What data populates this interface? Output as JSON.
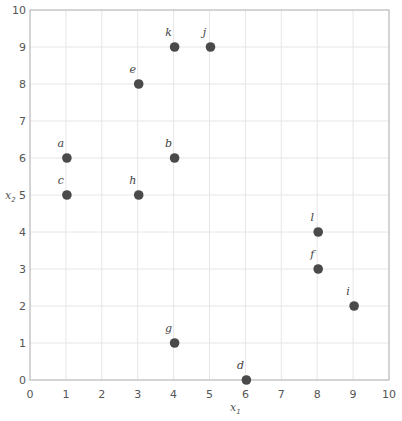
{
  "chart_data": {
    "type": "scatter",
    "title": "",
    "xlabel": "x1",
    "ylabel": "x2",
    "xlim": [
      0,
      10
    ],
    "ylim": [
      0,
      10
    ],
    "xticks": [
      0,
      1,
      2,
      3,
      4,
      5,
      6,
      7,
      8,
      9,
      10
    ],
    "yticks": [
      0,
      1,
      2,
      3,
      4,
      5,
      6,
      7,
      8,
      9,
      10
    ],
    "grid": true,
    "legend": null,
    "point_color": "#4a4a4a",
    "points": [
      {
        "label": "a",
        "x": 1,
        "y": 6
      },
      {
        "label": "b",
        "x": 4,
        "y": 6
      },
      {
        "label": "c",
        "x": 1,
        "y": 5
      },
      {
        "label": "d",
        "x": 6,
        "y": 0
      },
      {
        "label": "e",
        "x": 3,
        "y": 8
      },
      {
        "label": "f",
        "x": 8,
        "y": 3
      },
      {
        "label": "g",
        "x": 4,
        "y": 1
      },
      {
        "label": "h",
        "x": 3,
        "y": 5
      },
      {
        "label": "i",
        "x": 9,
        "y": 2
      },
      {
        "label": "j",
        "x": 5,
        "y": 9
      },
      {
        "label": "k",
        "x": 4,
        "y": 9
      },
      {
        "label": "l",
        "x": 8,
        "y": 4
      }
    ]
  },
  "axes": {
    "x_label_main": "x",
    "x_label_sub": "1",
    "y_label_main": "x",
    "y_label_sub": "2"
  }
}
